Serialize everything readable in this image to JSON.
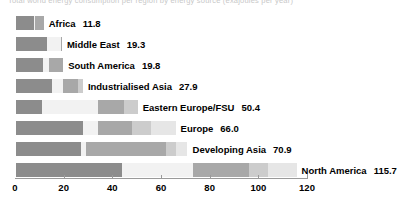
{
  "title_faint": "Total world energy consumption per region by energy source (exajoules per year)",
  "chart_data": {
    "type": "bar",
    "orientation": "horizontal",
    "stacked": true,
    "title": "",
    "xlabel": "",
    "ylabel": "",
    "xlim": [
      0,
      120
    ],
    "xticks": [
      0,
      20,
      40,
      60,
      80,
      100,
      120
    ],
    "xtick_labels": [
      "0",
      "20",
      "40",
      "60",
      "80",
      "100",
      "120"
    ],
    "grid": false,
    "legend": "none",
    "categories": [
      "Africa",
      "Middle East",
      "South America",
      "Industrialised Asia",
      "Eastern Europe/FSU",
      "Europe",
      "Developing Asia",
      "North America"
    ],
    "totals": [
      11.8,
      19.3,
      19.8,
      27.9,
      50.4,
      66.0,
      70.9,
      115.7
    ],
    "total_labels": [
      "11.8",
      "19.3",
      "19.8",
      "27.9",
      "50.4",
      "66.0",
      "70.9",
      "115.7"
    ],
    "segment_colors": [
      "#8c8c8c",
      "#f2f2f2",
      "#a8a8a8",
      "#cccccc",
      "#e6e6e6"
    ],
    "rows": [
      {
        "label": "Africa",
        "total": 11.8,
        "total_label": "11.8",
        "segments": [
          8.0,
          0.4,
          3.4,
          0.0,
          0.0
        ]
      },
      {
        "label": "Middle East",
        "total": 19.3,
        "total_label": "19.3",
        "segments": [
          13.0,
          5.9,
          0.4,
          0.0,
          0.0
        ]
      },
      {
        "label": "South America",
        "total": 19.8,
        "total_label": "19.8",
        "segments": [
          11.5,
          2.5,
          5.8,
          0.0,
          0.0
        ]
      },
      {
        "label": "Industrialised Asia",
        "total": 27.9,
        "total_label": "27.9",
        "segments": [
          15.0,
          4.6,
          6.4,
          1.9,
          0.0
        ]
      },
      {
        "label": "Eastern Europe/FSU",
        "total": 50.4,
        "total_label": "50.4",
        "segments": [
          11.0,
          23.0,
          11.0,
          5.4,
          0.0
        ]
      },
      {
        "label": "Europe",
        "total": 66.0,
        "total_label": "66.0",
        "segments": [
          28.0,
          6.0,
          14.0,
          8.0,
          10.0
        ]
      },
      {
        "label": "Developing Asia",
        "total": 70.9,
        "total_label": "70.9",
        "segments": [
          27.0,
          2.0,
          33.0,
          4.0,
          4.9
        ]
      },
      {
        "label": "North America",
        "total": 115.7,
        "total_label": "115.7",
        "segments": [
          44.0,
          29.0,
          23.0,
          8.0,
          11.7
        ]
      }
    ]
  }
}
